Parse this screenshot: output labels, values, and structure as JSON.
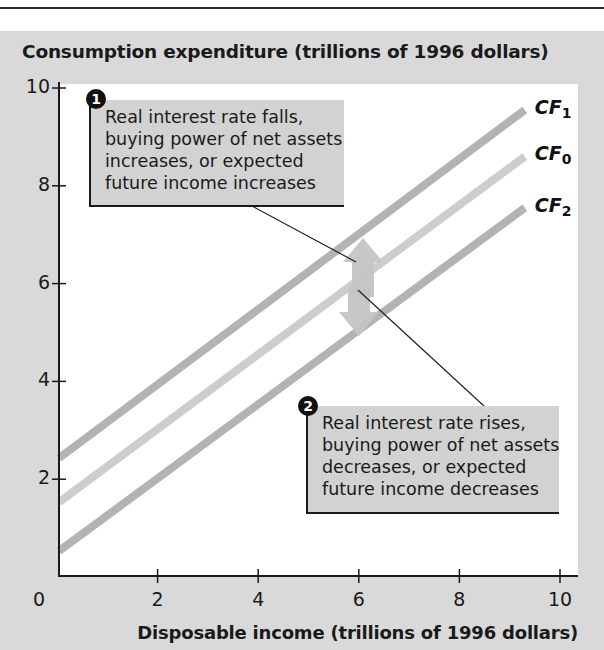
{
  "chart_data": {
    "type": "line",
    "title": "",
    "ylabel": "Consumption expenditure (trillions of 1996 dollars)",
    "xlabel": "Disposable income (trillions of 1996 dollars)",
    "xlim": [
      0,
      10
    ],
    "ylim": [
      0,
      10
    ],
    "x_ticks": [
      "0",
      "2",
      "4",
      "6",
      "8",
      "10"
    ],
    "y_ticks": [
      "2",
      "4",
      "6",
      "8",
      "10"
    ],
    "grid": false,
    "legend": "inline labels at right end of lines",
    "series": [
      {
        "name": "CF1",
        "label_base": "CF",
        "label_sub": "1",
        "x": [
          0,
          9.3
        ],
        "y": [
          2.4,
          9.55
        ],
        "color": "#b3b3b3"
      },
      {
        "name": "CF0",
        "label_base": "CF",
        "label_sub": "0",
        "x": [
          0,
          9.3
        ],
        "y": [
          1.5,
          8.6
        ],
        "color": "#cdcdcd"
      },
      {
        "name": "CF2",
        "label_base": "CF",
        "label_sub": "2",
        "x": [
          0,
          9.3
        ],
        "y": [
          0.5,
          7.55
        ],
        "color": "#b3b3b3"
      }
    ],
    "annotations": [
      {
        "number": "1",
        "lines": [
          "Real interest rate falls,",
          "buying power of net assets",
          "increases, or expected",
          "future income increases"
        ],
        "arrow": "up (CF0 shifts to CF1)"
      },
      {
        "number": "2",
        "lines": [
          "Real interest rate rises,",
          "buying power of net assets",
          "decreases, or expected",
          "future income decreases"
        ],
        "arrow": "down (CF0 shifts to CF2)"
      }
    ]
  },
  "colors": {
    "panel_background": "#d9d9d9",
    "plot_background": "#ffffff",
    "callout_background": "#d2d2d2",
    "axis": "#1a1a1a",
    "arrow": "#c4c4c4"
  }
}
